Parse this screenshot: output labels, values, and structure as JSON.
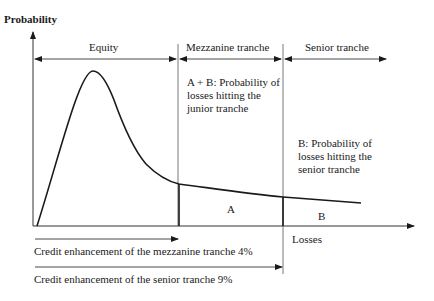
{
  "diagram": {
    "y_axis_label": "Probability",
    "x_axis_label": "Losses",
    "tranches": [
      {
        "name": "Equity"
      },
      {
        "name": "Mezzanine tranche"
      },
      {
        "name": "Senior tranche"
      }
    ],
    "annotations": {
      "junior": [
        "A + B: Probability of",
        "losses hitting the",
        "junior tranche"
      ],
      "senior": [
        "B: Probability of",
        "losses hitting the",
        "senior  tranche"
      ],
      "area_a": "A",
      "area_b": "B"
    },
    "credit_enhancements": [
      {
        "label": "Credit enhancement of the mezzanine tranche 4%"
      },
      {
        "label": "Credit enhancement of the senior tranche 9%"
      }
    ],
    "colors": {
      "line": "#1a1a1a",
      "thin_line": "#555555"
    }
  }
}
